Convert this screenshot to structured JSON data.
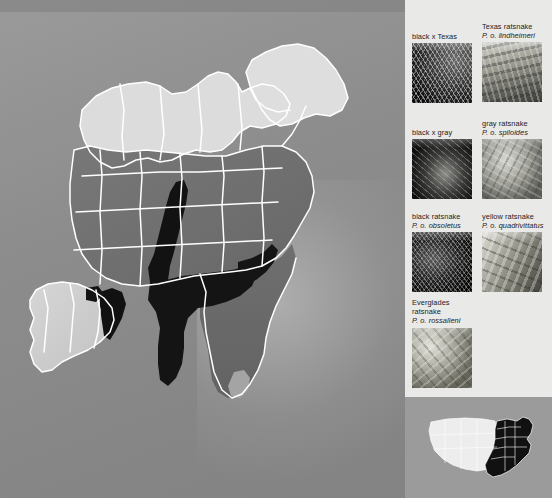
{
  "figure": {
    "type": "range-map",
    "background_color": "#8b8b8b",
    "legend_panel_color": "#e9e9e7",
    "map_outline_color": "#ffffff"
  },
  "map": {
    "name": "eastern-united-states-ratsnake-range-map",
    "shading": [
      {
        "key": "texas",
        "label": "Texas ratsnake",
        "color": "#cbcbcb"
      },
      {
        "key": "gray",
        "label": "gray ratsnake",
        "color": "#d9d9d9"
      },
      {
        "key": "black",
        "label": "black ratsnake",
        "color": "#707070"
      },
      {
        "key": "yellow",
        "label": "yellow ratsnake",
        "color": "#6a6a6a"
      },
      {
        "key": "everglades",
        "label": "Everglades ratsnake",
        "color": "#9e9e9e"
      },
      {
        "key": "hybrid",
        "label": "hybrid zone",
        "color": "#141414"
      }
    ]
  },
  "legend": {
    "items": [
      {
        "name": "black-x-texas",
        "title": "black x Texas",
        "scientific": "",
        "photo": "snake-photo-black-x-texas"
      },
      {
        "name": "texas-ratsnake",
        "title": "Texas ratsnake",
        "scientific": "P. o. lindheimeri",
        "photo": "snake-photo-texas-ratsnake"
      },
      {
        "name": "black-x-gray",
        "title": "black x gray",
        "scientific": "",
        "photo": "snake-photo-black-x-gray"
      },
      {
        "name": "gray-ratsnake",
        "title": "gray ratsnake",
        "scientific": "P. o. spiloides",
        "photo": "snake-photo-gray-ratsnake"
      },
      {
        "name": "black-ratsnake",
        "title": "black ratsnake",
        "scientific": "P. o. obsoletus",
        "photo": "snake-photo-black-ratsnake"
      },
      {
        "name": "yellow-ratsnake",
        "title": "yellow ratsnake",
        "scientific": "P. o. quadrivittatus",
        "photo": "snake-photo-yellow-ratsnake"
      },
      {
        "name": "everglades-ratsnake",
        "title": "Everglades ratsnake",
        "title_line1": "Everglades",
        "title_line2": "ratsnake",
        "scientific": "P. o. rossalleni",
        "photo": "snake-photo-everglades-ratsnake"
      }
    ]
  },
  "locator": {
    "name": "united-states-locator-inset",
    "highlight_color": "#111111",
    "base_color": "#ececec",
    "panel_color": "#9a9a9a",
    "description": "United States outline with eastern states filled dark"
  }
}
